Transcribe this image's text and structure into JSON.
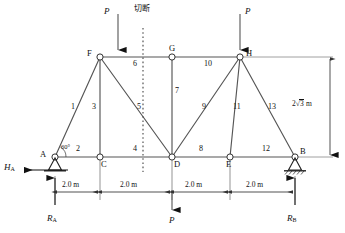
{
  "figure": {
    "type": "truss-diagram",
    "line_color": "#555555",
    "text_color": "#111111"
  },
  "nodes": [
    {
      "id": "A",
      "label": "A",
      "x": 55,
      "y": 157,
      "support": "pin",
      "label_x": 40,
      "label_y": 150
    },
    {
      "id": "C",
      "label": "C",
      "x": 100,
      "y": 157,
      "support": "none",
      "label_x": 101,
      "label_y": 160
    },
    {
      "id": "D",
      "label": "D",
      "x": 172,
      "y": 157,
      "support": "none",
      "label_x": 174,
      "label_y": 160
    },
    {
      "id": "E",
      "label": "E",
      "x": 230,
      "y": 157,
      "support": "none",
      "label_x": 226,
      "label_y": 160
    },
    {
      "id": "B",
      "label": "B",
      "x": 295,
      "y": 157,
      "support": "roller",
      "label_x": 300,
      "label_y": 148
    },
    {
      "id": "F",
      "label": "F",
      "x": 100,
      "y": 57,
      "support": "none",
      "label_x": 87,
      "label_y": 50
    },
    {
      "id": "G",
      "label": "G",
      "x": 172,
      "y": 57,
      "support": "none",
      "label_x": 169,
      "label_y": 44
    },
    {
      "id": "H",
      "label": "H",
      "x": 240,
      "y": 57,
      "support": "none",
      "label_x": 246,
      "label_y": 50
    }
  ],
  "members": [
    {
      "number": "1",
      "from": "A",
      "to": "F",
      "label_x": 71,
      "label_y": 105
    },
    {
      "number": "2",
      "from": "A",
      "to": "C",
      "label_x": 76,
      "label_y": 148
    },
    {
      "number": "3",
      "from": "F",
      "to": "C",
      "label_x": 93,
      "label_y": 105
    },
    {
      "number": "4",
      "from": "C",
      "to": "D",
      "label_x": 133,
      "label_y": 148
    },
    {
      "number": "5",
      "from": "F",
      "to": "D",
      "label_x": 138,
      "label_y": 105
    },
    {
      "number": "6",
      "from": "F",
      "to": "G",
      "label_x": 133,
      "label_y": 63
    },
    {
      "number": "7",
      "from": "G",
      "to": "D",
      "label_x": 175,
      "label_y": 90
    },
    {
      "number": "8",
      "from": "D",
      "to": "E",
      "label_x": 199,
      "label_y": 148
    },
    {
      "number": "9",
      "from": "H",
      "to": "D",
      "label_x": 203,
      "label_y": 105
    },
    {
      "number": "10",
      "from": "G",
      "to": "H",
      "label_x": 205,
      "label_y": 63
    },
    {
      "number": "11",
      "from": "H",
      "to": "E",
      "label_x": 232,
      "label_y": 105
    },
    {
      "number": "12",
      "from": "E",
      "to": "B",
      "label_x": 262,
      "label_y": 148
    },
    {
      "number": "13",
      "from": "H",
      "to": "B",
      "label_x": 269,
      "label_y": 105
    }
  ],
  "loads": [
    {
      "id": "load-F",
      "label": "P",
      "at": "F",
      "direction": "down",
      "label_x": 101,
      "label_y": 8,
      "tip_x": 118,
      "tip_y": 57,
      "tail_y": 14
    },
    {
      "id": "load-H",
      "label": "P",
      "at": "H",
      "direction": "down",
      "label_x": 250,
      "label_y": 8,
      "tip_x": 240,
      "tip_y": 57,
      "tail_y": 14
    },
    {
      "id": "load-D",
      "label": "P",
      "at": "D",
      "direction": "down",
      "label_x": 168,
      "label_y": 218,
      "tip_x": 172,
      "tip_y": 217,
      "tail_y": 190
    }
  ],
  "reactions": [
    {
      "id": "HA",
      "label": "H",
      "sub": "A",
      "label_x": 4,
      "label_y": 164,
      "direction": "left"
    },
    {
      "id": "RA",
      "label": "R",
      "sub": "A",
      "label_x": 48,
      "label_y": 216,
      "direction": "up"
    },
    {
      "id": "RB",
      "label": "R",
      "sub": "B",
      "label_x": 288,
      "label_y": 216,
      "direction": "up"
    }
  ],
  "dimensions": {
    "horizontal": [
      {
        "text": "2.0 m",
        "from_x": 55,
        "to_x": 100,
        "label_x": 63,
        "label_y": 183
      },
      {
        "text": "2.0 m",
        "from_x": 100,
        "to_x": 172,
        "label_x": 120,
        "label_y": 183
      },
      {
        "text": "2.0 m",
        "from_x": 172,
        "to_x": 230,
        "label_x": 186,
        "label_y": 183
      },
      {
        "text": "2.0 m",
        "from_x": 230,
        "to_x": 295,
        "label_x": 247,
        "label_y": 183
      }
    ],
    "vertical": {
      "text_prefix": "2",
      "text_radicand": "3",
      "text_suffix": " m",
      "label_x": 293,
      "label_y": 101,
      "x": 330,
      "from_y": 57,
      "to_y": 157
    }
  },
  "annotations": {
    "angle": {
      "text": "60°",
      "x": 62,
      "y": 146
    },
    "cut": {
      "text": "切断",
      "x": 135,
      "y": 5,
      "line_x": 143,
      "from_y": 28,
      "to_y": 172
    }
  }
}
